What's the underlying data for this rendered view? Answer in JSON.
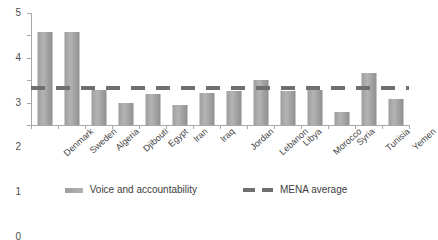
{
  "chart_data": {
    "type": "bar",
    "title": "",
    "xlabel": "",
    "ylabel": "",
    "ylim": [
      0,
      5
    ],
    "ytick_step": 1,
    "yticks": [
      "0",
      "1",
      "2",
      "3",
      "4",
      "5"
    ],
    "grid": false,
    "legend_position": "bottom",
    "categories": [
      "Denmark",
      "Sweden",
      "Algeria",
      "Djibouti",
      "Egypt",
      "Iran",
      "Iraq",
      "Jordan",
      "Lebanon",
      "Libya",
      "Morocco",
      "Syria",
      "Tunisia",
      "Yemen"
    ],
    "series": [
      {
        "name": "Voice and accountability",
        "type": "bar",
        "color": "#a5a5a5",
        "values": [
          4.15,
          4.15,
          1.55,
          1.0,
          1.4,
          0.9,
          1.45,
          1.5,
          2.0,
          1.5,
          1.55,
          0.6,
          2.3,
          1.15
        ]
      },
      {
        "name": "MENA average",
        "type": "reference-line",
        "style": "dashed",
        "color": "#6f6f6f",
        "value": 1.65
      }
    ]
  },
  "legend": {
    "items": [
      {
        "label": "Voice and accountability",
        "marker": "bar-swatch",
        "color": "#a5a5a5"
      },
      {
        "label": "MENA average",
        "marker": "dashed-line-swatch",
        "color": "#6f6f6f"
      }
    ]
  },
  "axes": {
    "y_axis_name": "value-axis",
    "x_axis_name": "category-axis"
  }
}
